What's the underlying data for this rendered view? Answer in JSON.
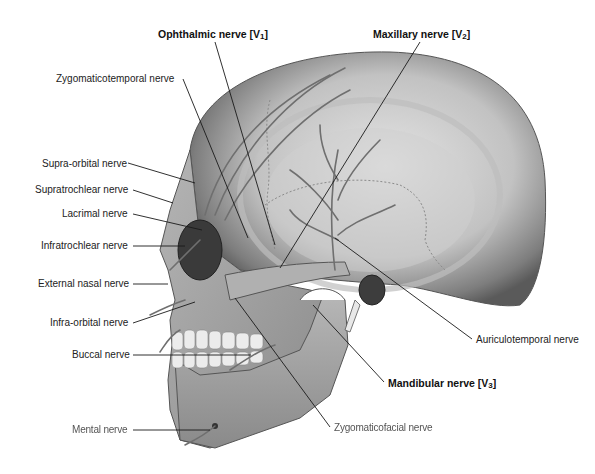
{
  "figure": {
    "labels": {
      "ophthalmic": {
        "text": "Ophthalmic nerve [V",
        "sub": "1",
        "tail": "]"
      },
      "maxillary": {
        "text": "Maxillary nerve [V",
        "sub": "2",
        "tail": "]"
      },
      "mandibular": {
        "text": "Mandibular nerve [V",
        "sub": "3",
        "tail": "]"
      },
      "zygomaticotemporal": "Zygomaticotemporal nerve",
      "supra_orbital": "Supra-orbital nerve",
      "supratrochlear": "Supratrochlear nerve",
      "lacrimal": "Lacrimal nerve",
      "infratrochlear": "Infratrochlear nerve",
      "external_nasal": "External nasal nerve",
      "infra_orbital": "Infra-orbital nerve",
      "buccal": "Buccal nerve",
      "mental": "Mental nerve",
      "auriculotemporal": "Auriculotemporal nerve",
      "zygomaticofacial": "Zygomaticofacial nerve"
    },
    "colors": {
      "bone_light": "#d9d9d9",
      "bone_mid": "#a8a8a8",
      "bone_dark": "#5e5e5e",
      "nerve": "#6f6f6f",
      "leader": "#1a1a1a"
    }
  }
}
